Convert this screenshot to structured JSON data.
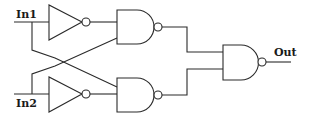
{
  "diagram": {
    "type": "logic-circuit",
    "labels": {
      "input1": "In1",
      "input2": "In2",
      "output": "Out"
    },
    "gates": [
      {
        "id": "inv1",
        "kind": "NOT",
        "inputs": [
          "In1"
        ]
      },
      {
        "id": "inv2",
        "kind": "NOT",
        "inputs": [
          "In2"
        ]
      },
      {
        "id": "nand1",
        "kind": "NAND",
        "inputs": [
          "inv1",
          "In2"
        ]
      },
      {
        "id": "nand2",
        "kind": "NAND",
        "inputs": [
          "In1",
          "inv2"
        ]
      },
      {
        "id": "nand3",
        "kind": "NAND",
        "inputs": [
          "nand1",
          "nand2"
        ],
        "output": "Out"
      }
    ],
    "colors": {
      "stroke": "#2a2a2a",
      "background": "#ffffff"
    }
  }
}
